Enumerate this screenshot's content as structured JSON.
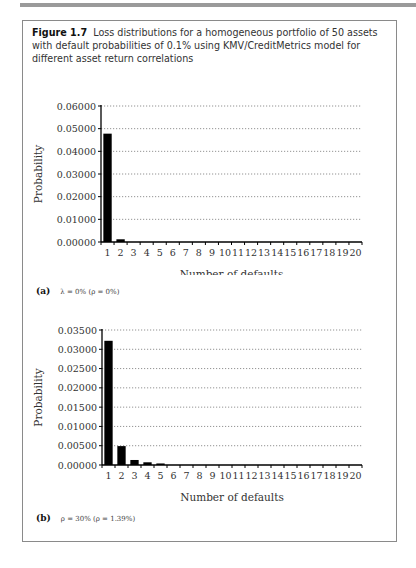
{
  "figure": {
    "number": "Figure 1.7",
    "caption": "Loss distributions for a homogeneous portfolio of 50 assets with default probabilities of 0.1% using KMV/CreditMetrics model for different asset return correlations"
  },
  "panels": [
    {
      "letter": "(a)",
      "label": "λ = 0% (ρ = 0%)"
    },
    {
      "letter": "(b)",
      "label": "ρ = 30% (ρ = 1.39%)"
    }
  ],
  "chart_data": [
    {
      "type": "bar",
      "title": "(a) λ = 0% (ρ = 0%)",
      "xlabel": "Number of defaults",
      "ylabel": "Probability",
      "categories": [
        "1",
        "2",
        "3",
        "4",
        "5",
        "6",
        "7",
        "8",
        "9",
        "10",
        "11",
        "12",
        "13",
        "14",
        "15",
        "16",
        "17",
        "18",
        "19",
        "20"
      ],
      "values": [
        0.0478,
        0.0012,
        0,
        0,
        0,
        0,
        0,
        0,
        0,
        0,
        0,
        0,
        0,
        0,
        0,
        0,
        0,
        0,
        0,
        0
      ],
      "yticks": [
        "0.00000",
        "0.01000",
        "0.02000",
        "0.03000",
        "0.04000",
        "0.05000",
        "0.06000"
      ],
      "ylim": [
        0,
        0.06
      ],
      "grid": "horizontal dotted",
      "bar_color": "#000000"
    },
    {
      "type": "bar",
      "title": "(b) ρ = 30% (ρ = 1.39%)",
      "xlabel": "Number of defaults",
      "ylabel": "Probability",
      "categories": [
        "1",
        "2",
        "3",
        "4",
        "5",
        "6",
        "7",
        "8",
        "9",
        "10",
        "11",
        "12",
        "13",
        "14",
        "15",
        "16",
        "17",
        "18",
        "19",
        "20"
      ],
      "values": [
        0.0322,
        0.0049,
        0.0013,
        0.0007,
        0.0004,
        0,
        0,
        0,
        0,
        0,
        0,
        0,
        0,
        0,
        0,
        0,
        0,
        0,
        0,
        0
      ],
      "yticks": [
        "0.00000",
        "0.00500",
        "0.01000",
        "0.01500",
        "0.02000",
        "0.02500",
        "0.03000",
        "0.03500"
      ],
      "ylim": [
        0,
        0.035
      ],
      "grid": "horizontal dotted",
      "bar_color": "#000000"
    }
  ]
}
